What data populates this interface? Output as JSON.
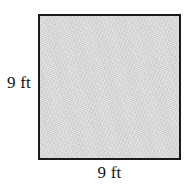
{
  "figure": {
    "kind": "square-diagram",
    "background_color": "#ffffff",
    "shape": {
      "name": "square",
      "fill_color": "#d2d2d2",
      "stroke_color": "#1a1a1a",
      "stroke_width_px": 2
    },
    "labels": {
      "left": "9 ft",
      "bottom": "9 ft"
    },
    "measurements": {
      "side_length_value": "9",
      "unit": "ft",
      "width": "9 ft",
      "height": "9 ft"
    }
  }
}
